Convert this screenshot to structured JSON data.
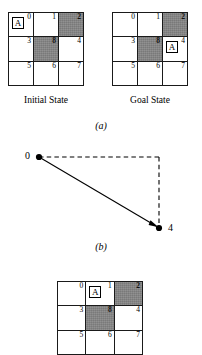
{
  "figure": {
    "panel_a_label": "(a)",
    "panel_b_label": "(b)"
  },
  "grids": {
    "initial": {
      "caption": "Initial State",
      "agent_label": "A",
      "agent_cell_index": 0,
      "cells": [
        {
          "number": "0",
          "shaded": false,
          "agent": true
        },
        {
          "number": "1",
          "shaded": false,
          "agent": false
        },
        {
          "number": "2",
          "shaded": true,
          "agent": false
        },
        {
          "number": "3",
          "shaded": false,
          "agent": false
        },
        {
          "number": "8",
          "shaded": true,
          "agent": false
        },
        {
          "number": "4",
          "shaded": false,
          "agent": false
        },
        {
          "number": "5",
          "shaded": false,
          "agent": false
        },
        {
          "number": "6",
          "shaded": false,
          "agent": false
        },
        {
          "number": "7",
          "shaded": false,
          "agent": false
        }
      ]
    },
    "goal": {
      "caption": "Goal State",
      "agent_label": "A",
      "agent_cell_index": 5,
      "cells": [
        {
          "number": "0",
          "shaded": false,
          "agent": false
        },
        {
          "number": "1",
          "shaded": false,
          "agent": false
        },
        {
          "number": "2",
          "shaded": true,
          "agent": false
        },
        {
          "number": "3",
          "shaded": false,
          "agent": false
        },
        {
          "number": "8",
          "shaded": true,
          "agent": false
        },
        {
          "number": "4",
          "shaded": false,
          "agent": true
        },
        {
          "number": "5",
          "shaded": false,
          "agent": false
        },
        {
          "number": "6",
          "shaded": false,
          "agent": false
        },
        {
          "number": "7",
          "shaded": false,
          "agent": false
        }
      ]
    },
    "bottom": {
      "caption": "",
      "agent_label": "A",
      "agent_cell_index": 1,
      "cells": [
        {
          "number": "0",
          "shaded": false,
          "agent": false
        },
        {
          "number": "1",
          "shaded": false,
          "agent": true
        },
        {
          "number": "2",
          "shaded": true,
          "agent": false
        },
        {
          "number": "3",
          "shaded": false,
          "agent": false
        },
        {
          "number": "8",
          "shaded": true,
          "agent": false
        },
        {
          "number": "4",
          "shaded": false,
          "agent": false
        },
        {
          "number": "5",
          "shaded": false,
          "agent": false
        },
        {
          "number": "6",
          "shaded": false,
          "agent": false
        },
        {
          "number": "7",
          "shaded": false,
          "agent": false
        }
      ]
    }
  },
  "graph": {
    "nodes": [
      {
        "id": "0",
        "label": "0",
        "x": 39,
        "y": 22
      },
      {
        "id": "4",
        "label": "4",
        "x": 159,
        "y": 93
      }
    ],
    "edges": [
      {
        "from": "0",
        "to": "4",
        "style": "solid",
        "arrow": true
      },
      {
        "from": "0",
        "to": "corner",
        "style": "dashed",
        "arrow": false
      },
      {
        "from": "corner",
        "to": "4",
        "style": "dashed",
        "arrow": false
      }
    ],
    "corner": {
      "x": 159,
      "y": 22
    },
    "line_color": "#000000"
  },
  "colors": {
    "shaded_cell": "#858585",
    "grid_line": "#1a1a1a",
    "background": "#ffffff"
  }
}
